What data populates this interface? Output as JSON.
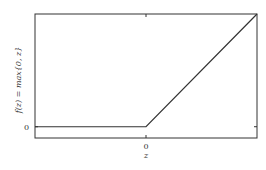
{
  "chart_data": {
    "type": "line",
    "title": "",
    "xlabel": "z",
    "ylabel": "f(z) = max{0, z}",
    "xlim": [
      -1,
      1
    ],
    "ylim": [
      -0.1,
      1
    ],
    "x_ticks": [
      {
        "value": 0,
        "label": "0"
      }
    ],
    "y_ticks": [
      {
        "value": 0,
        "label": "0"
      }
    ],
    "grid": false,
    "series": [
      {
        "name": "ReLU",
        "x": [
          -1,
          0,
          1
        ],
        "y": [
          0,
          0,
          1
        ],
        "color": "#333333"
      }
    ]
  }
}
